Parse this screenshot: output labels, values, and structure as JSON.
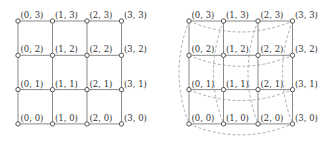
{
  "diagrams": [
    {
      "name": "mesh-grid",
      "origin_x": 18,
      "edges_style": "solid",
      "wrap_edges": false
    },
    {
      "name": "torus-grid",
      "origin_x": 189,
      "edges_style": "solid",
      "wrap_edges": true
    }
  ],
  "grid": {
    "cols": 4,
    "rows": 4,
    "spacing_x": 34.5,
    "spacing_y": 34.3,
    "top_y": 21,
    "labels": [
      [
        "(0, 3)",
        "(1, 3)",
        "(2, 3)",
        "(3, 3)"
      ],
      [
        "(0, 2)",
        "(1, 2)",
        "(2, 2)",
        "(3, 2)"
      ],
      [
        "(0, 1)",
        "(1, 1)",
        "(2, 1)",
        "(3, 1)"
      ],
      [
        "(0, 0)",
        "(1, 0)",
        "(2, 0)",
        "(3, 0)"
      ]
    ]
  },
  "colors": {
    "edge": "#8a8a8a",
    "node_stroke": "#555555",
    "node_fill": "#ffffff",
    "dashed": "#9a9a9a",
    "label": "#333333"
  }
}
